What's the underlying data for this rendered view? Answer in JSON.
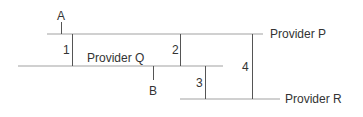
{
  "diagram": {
    "providers": [
      {
        "id": "P",
        "label": "Provider P"
      },
      {
        "id": "Q",
        "label": "Provider Q"
      },
      {
        "id": "R",
        "label": "Provider R"
      }
    ],
    "segments": [
      {
        "id": "1",
        "label": "1"
      },
      {
        "id": "2",
        "label": "2"
      },
      {
        "id": "3",
        "label": "3"
      },
      {
        "id": "4",
        "label": "4"
      }
    ],
    "points": [
      {
        "id": "A",
        "label": "A"
      },
      {
        "id": "B",
        "label": "B"
      }
    ],
    "colors": {
      "line": "#d0d0d0",
      "connector": "#555555",
      "text": "#333333"
    }
  }
}
